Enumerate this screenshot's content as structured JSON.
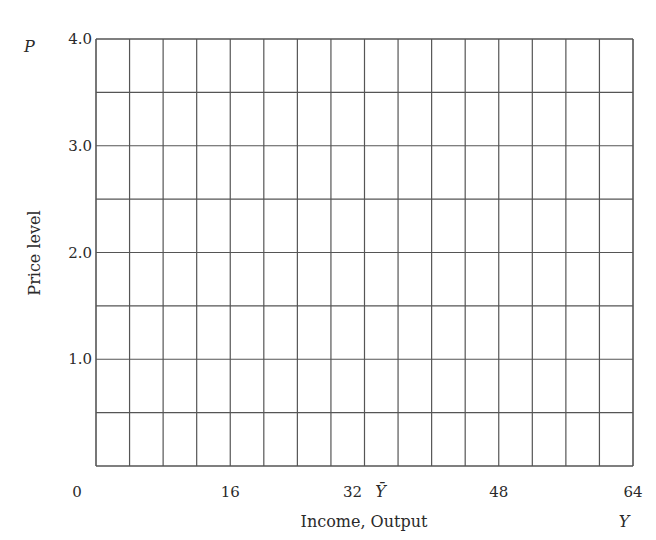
{
  "chart_data": {
    "type": "line",
    "title": "",
    "xlabel": "Income, Output",
    "ylabel": "Price level",
    "x_axis_symbol": "Y",
    "y_axis_symbol": "P",
    "xlim": [
      0,
      64
    ],
    "ylim": [
      0,
      4.0
    ],
    "x_ticks": [
      {
        "value": 0,
        "label": "0"
      },
      {
        "value": 16,
        "label": "16"
      },
      {
        "value": 32,
        "label": "32"
      },
      {
        "value": 48,
        "label": "48"
      },
      {
        "value": 64,
        "label": "64"
      }
    ],
    "y_ticks": [
      {
        "value": 1.0,
        "label": "1.0"
      },
      {
        "value": 2.0,
        "label": "2.0"
      },
      {
        "value": 3.0,
        "label": "3.0"
      },
      {
        "value": 4.0,
        "label": "4.0"
      }
    ],
    "annotations": [
      {
        "x": 32,
        "label": "Ȳ",
        "meaning": "Y-bar (full-employment output)"
      }
    ],
    "grid": true,
    "grid_x_step": 4,
    "grid_y_step": 0.5,
    "series": []
  },
  "colors": {
    "grid": "#555555",
    "text": "#2a2a2a"
  }
}
